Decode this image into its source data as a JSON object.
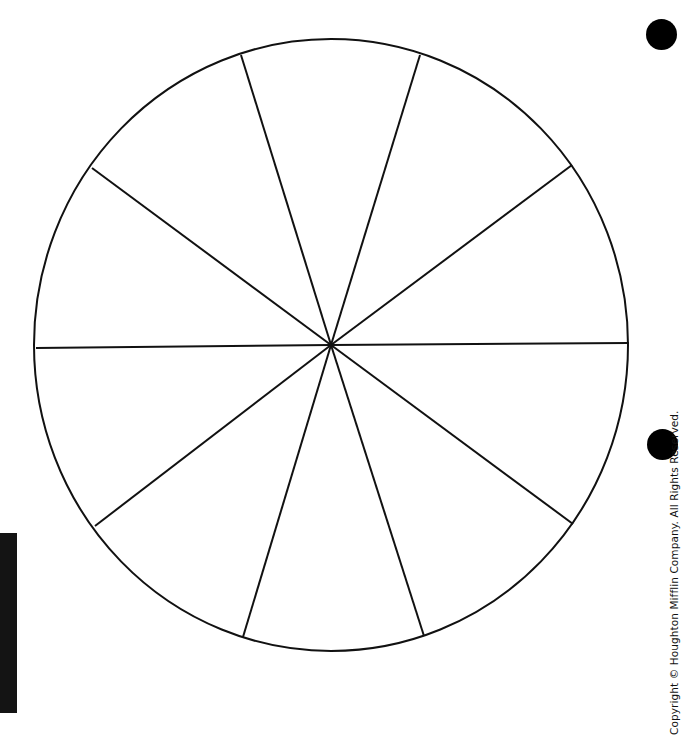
{
  "diagram": {
    "type": "blank-pie-wheel",
    "sections": 10,
    "center": {
      "x": 331,
      "y": 345
    },
    "radius_x": 297,
    "radius_y": 306,
    "stroke_color": "#111111",
    "stroke_width": 2,
    "spoke_endpoints": [
      {
        "x": 241,
        "y": 55
      },
      {
        "x": 420,
        "y": 55
      },
      {
        "x": 572,
        "y": 165
      },
      {
        "x": 629,
        "y": 343
      },
      {
        "x": 573,
        "y": 524
      },
      {
        "x": 424,
        "y": 636
      },
      {
        "x": 243,
        "y": 637
      },
      {
        "x": 95,
        "y": 526
      },
      {
        "x": 36,
        "y": 348
      },
      {
        "x": 92,
        "y": 168
      }
    ]
  },
  "page": {
    "copyright": "Copyright © Houghton Mifflin Company. All Rights Reserved.",
    "punch_hole_color": "#000000",
    "edge_bar_color": "#141414"
  }
}
